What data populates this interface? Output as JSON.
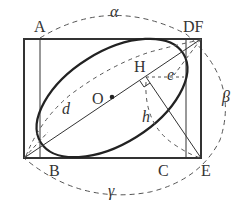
{
  "diagram": {
    "type": "geometry",
    "labels": {
      "A": "A",
      "DF": "DF",
      "H": "H",
      "O": "O",
      "e": "e",
      "d": "d",
      "h": "h",
      "B": "B",
      "C": "C",
      "E": "E",
      "alpha": "α",
      "beta": "β",
      "gamma": "γ"
    },
    "colors": {
      "stroke": "#333333",
      "background": "#ffffff"
    }
  }
}
